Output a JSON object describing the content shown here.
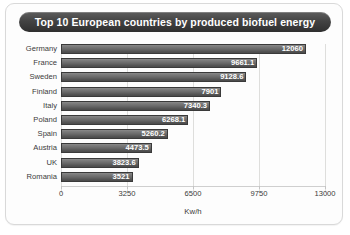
{
  "card": {
    "title": "Top 10 European countries by produced biofuel energy"
  },
  "chart_data": {
    "type": "bar",
    "orientation": "horizontal",
    "title": "Top 10 European countries by produced biofuel energy",
    "xlabel": "Kw/h",
    "ylabel": "",
    "categories": [
      "Germany",
      "France",
      "Sweden",
      "Finland",
      "Italy",
      "Poland",
      "Spain",
      "Austria",
      "UK",
      "Romania"
    ],
    "values": [
      12060,
      9661.1,
      9128.6,
      7901,
      7340.3,
      6268.1,
      5260.2,
      4473.5,
      3823.6,
      3521
    ],
    "value_labels": [
      "12060",
      "9661.1",
      "9128.6",
      "7901",
      "7340.3",
      "6268.1",
      "5260.2",
      "4473.5",
      "3823.6",
      "3521"
    ],
    "xlim": [
      0,
      13000
    ],
    "xticks": [
      0,
      3250,
      6500,
      9750,
      13000
    ],
    "xtick_labels": [
      "0",
      "3250",
      "6500",
      "9750",
      "13000"
    ],
    "grid": true,
    "grid_axis": "x",
    "legend": null,
    "bar_color": "#686868",
    "label_color": "#ffffff",
    "title_background": "#3c3c3c"
  }
}
